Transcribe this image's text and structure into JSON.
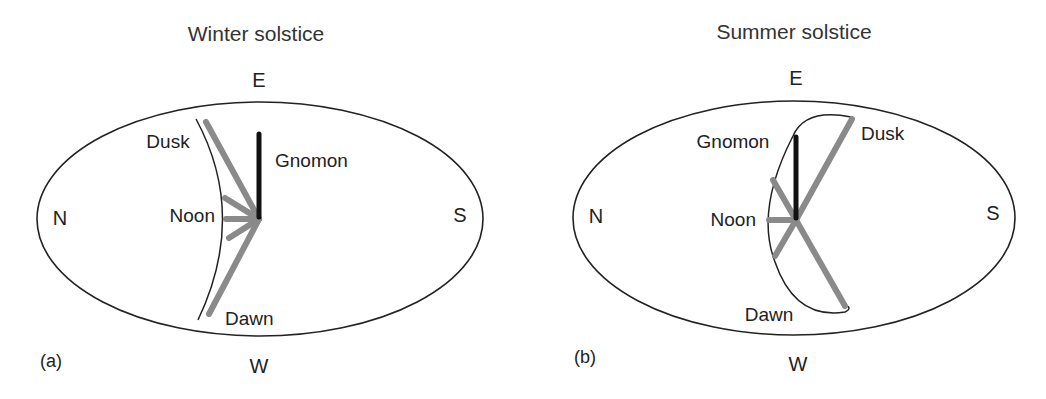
{
  "panels": [
    {
      "id": "a",
      "title": "Winter solstice",
      "panel_label": "(a)",
      "directions": {
        "top": "E",
        "bottom": "W",
        "left": "N",
        "right": "S"
      },
      "labels": {
        "gnomon": "Gnomon",
        "dusk": "Dusk",
        "noon": "Noon",
        "dawn": "Dawn"
      }
    },
    {
      "id": "b",
      "title": "Summer solstice",
      "panel_label": "(b)",
      "directions": {
        "top": "E",
        "bottom": "W",
        "left": "N",
        "right": "S"
      },
      "labels": {
        "gnomon": "Gnomon",
        "dusk": "Dusk",
        "noon": "Noon",
        "dawn": "Dawn"
      }
    }
  ],
  "colors": {
    "outline": "#222222",
    "gnomon": "#111111",
    "shadow": "#8a8a8a"
  }
}
